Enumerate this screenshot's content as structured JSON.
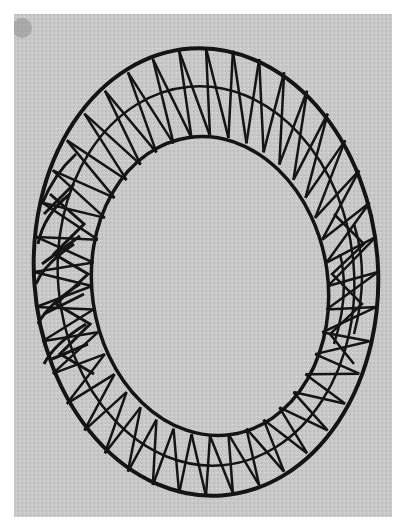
{
  "image": {
    "subject": "wireframe-mobius-ring",
    "description": "Grayscale halftone photograph of a twisted band (Möbius-strip-like) made of a triangulated wire/rod lattice, viewed from above on a gray background",
    "colors": {
      "page_background": "#ffffff",
      "photo_background": "#c9c9c9",
      "inner_background": "#bdbdbd",
      "wire": "#141414"
    }
  }
}
